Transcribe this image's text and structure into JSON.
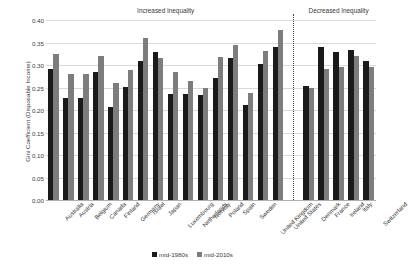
{
  "chart_data": {
    "type": "bar",
    "title": "",
    "xlabel": "",
    "ylabel": "Gini Coefficient (Disposable Income)",
    "ylim": [
      0.0,
      0.4
    ],
    "ytick_labels": [
      "0.40",
      "0.35",
      "0.30",
      "0.25",
      "0.20",
      "0.15",
      "0.10",
      "0.05",
      "0.00"
    ],
    "ytick_values": [
      0.4,
      0.35,
      0.3,
      0.25,
      0.2,
      0.15,
      0.1,
      0.05,
      0.0
    ],
    "grid": "horizontal",
    "legend_position": "bottom-center",
    "categories": [
      "Australia",
      "Austria",
      "Belgium",
      "Canada",
      "Finland",
      "Germany",
      "Israel",
      "Japan",
      "Luxembourg",
      "Netherlands",
      "Norway",
      "Poland",
      "Spain",
      "Sweden",
      "United Kingdom",
      "United States",
      "Denmark",
      "France",
      "Ireland",
      "Italy",
      "Switzerland"
    ],
    "series": [
      {
        "name": "mid-1980s",
        "color": "#1a1a1a",
        "values": [
          0.292,
          0.226,
          0.226,
          0.284,
          0.207,
          0.251,
          0.309,
          0.328,
          0.236,
          0.236,
          0.234,
          0.272,
          0.315,
          0.212,
          0.303,
          0.341,
          0.254,
          0.339,
          0.329,
          0.333,
          0.31
        ]
      },
      {
        "name": "mid-2010s",
        "color": "#7d7d7d",
        "values": [
          0.325,
          0.279,
          0.28,
          0.321,
          0.259,
          0.29,
          0.361,
          0.316,
          0.285,
          0.264,
          0.248,
          0.317,
          0.344,
          0.237,
          0.332,
          0.378,
          0.25,
          0.291,
          0.295,
          0.32,
          0.296
        ]
      }
    ],
    "annotations": [
      {
        "name": "increased-inequality",
        "text": "Increased Inequality",
        "start_index": 0,
        "end_index": 15
      },
      {
        "name": "decreased-inequality",
        "text": "Decreased Inequality",
        "start_index": 16,
        "end_index": 20
      }
    ],
    "divider_after_index": 15
  },
  "legend": {
    "items": [
      {
        "label": "mid-1980s",
        "color": "#1a1a1a"
      },
      {
        "label": "mid-2010s",
        "color": "#7d7d7d"
      }
    ]
  }
}
